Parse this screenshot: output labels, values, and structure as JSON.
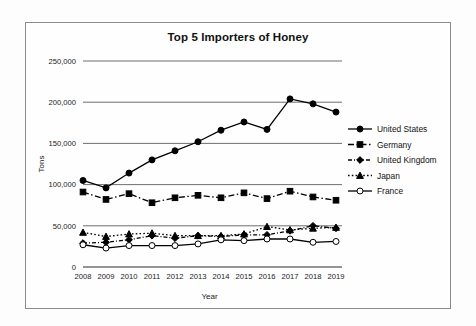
{
  "chart": {
    "title": "Top 5 Importers of Honey",
    "xlabel": "Year",
    "ylabel": "Tons"
  },
  "ytick_labels": [
    "250,000",
    "200,000",
    "150,000",
    "100,000",
    "50,000",
    "0"
  ],
  "xtick_labels": [
    "2008",
    "2009",
    "2010",
    "2011",
    "2012",
    "2013",
    "2014",
    "2015",
    "2016",
    "2017",
    "2018",
    "2019"
  ],
  "legend": [
    {
      "label": "United States",
      "marker": "circle-filled",
      "dash": "solid"
    },
    {
      "label": "Germany",
      "marker": "square-filled",
      "dash": "dash-dot"
    },
    {
      "label": "United Kingdom",
      "marker": "diamond-filled",
      "dash": "dash-dot-fine"
    },
    {
      "label": "Japan",
      "marker": "triangle-filled",
      "dash": "dotted"
    },
    {
      "label": "France",
      "marker": "circle-open",
      "dash": "solid"
    }
  ],
  "chart_data": {
    "type": "line",
    "title": "Top 5 Importers of Honey",
    "xlabel": "Year",
    "ylabel": "Tons",
    "categories": [
      "2008",
      "2009",
      "2010",
      "2011",
      "2012",
      "2013",
      "2014",
      "2015",
      "2016",
      "2017",
      "2018",
      "2019"
    ],
    "ylim": [
      0,
      250000
    ],
    "ytick_values": [
      0,
      50000,
      100000,
      150000,
      200000,
      250000
    ],
    "grid": "horizontal",
    "legend_position": "right",
    "series": [
      {
        "name": "United States",
        "marker": "circle-filled",
        "dash": "solid",
        "values": [
          105000,
          96000,
          114000,
          130000,
          141000,
          152000,
          166000,
          176000,
          167000,
          204000,
          198000,
          188000
        ]
      },
      {
        "name": "Germany",
        "marker": "square-filled",
        "dash": "dash-dot",
        "values": [
          91000,
          82000,
          89000,
          78000,
          84000,
          87000,
          84000,
          90000,
          83000,
          92000,
          85000,
          81000
        ]
      },
      {
        "name": "United Kingdom",
        "marker": "diamond-filled",
        "dash": "dash-dot-fine",
        "values": [
          29000,
          30000,
          33000,
          38000,
          35000,
          38000,
          37000,
          39000,
          39000,
          44000,
          50000,
          47000
        ]
      },
      {
        "name": "Japan",
        "marker": "triangle-filled",
        "dash": "dotted",
        "values": [
          42000,
          37000,
          40000,
          41000,
          38000,
          38000,
          38000,
          40000,
          49000,
          45000,
          47000,
          48000
        ]
      },
      {
        "name": "France",
        "marker": "circle-open",
        "dash": "solid",
        "values": [
          27000,
          23000,
          26000,
          26000,
          26000,
          28000,
          33000,
          32000,
          34000,
          34000,
          30000,
          31000
        ]
      }
    ]
  }
}
